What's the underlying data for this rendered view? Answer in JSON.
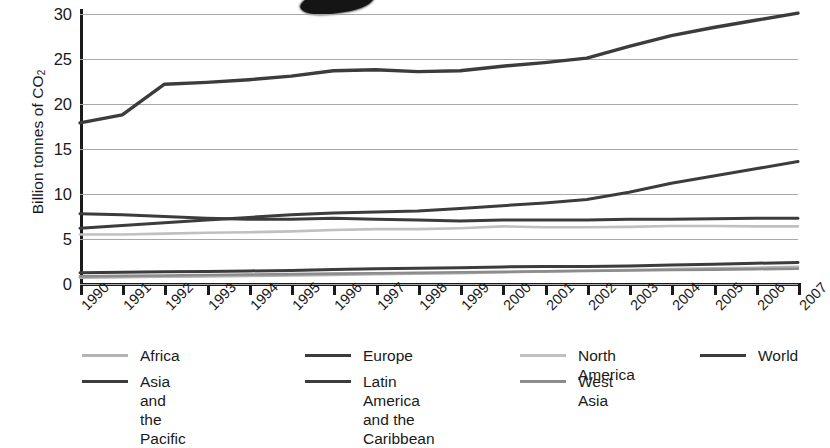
{
  "chart_data": {
    "type": "line",
    "title": "",
    "xlabel": "",
    "ylabel": "Billion tonnes of CO2",
    "ylabel_display": "Billion tonnes of CO",
    "ylabel_sub": "2",
    "ylim": [
      0,
      30
    ],
    "yticks": [
      0,
      5,
      10,
      15,
      20,
      25,
      30
    ],
    "grid": true,
    "legend_position": "bottom",
    "x": [
      1990,
      1991,
      1992,
      1993,
      1994,
      1995,
      1996,
      1997,
      1998,
      1999,
      2000,
      2001,
      2002,
      2003,
      2004,
      2005,
      2006,
      2007
    ],
    "categories": [
      "1990",
      "1991",
      "1992",
      "1993",
      "1994",
      "1995",
      "1996",
      "1997",
      "1998",
      "1999",
      "2000",
      "2001",
      "2002",
      "2003",
      "2004",
      "2005",
      "2006",
      "2007"
    ],
    "series": [
      {
        "name": "Africa",
        "color": "#b4b4b4",
        "width": 2.6,
        "values": [
          0.7,
          0.75,
          0.8,
          0.85,
          0.9,
          0.95,
          1.0,
          1.1,
          1.15,
          1.2,
          1.3,
          1.4,
          1.5,
          1.55,
          1.65,
          1.75,
          1.8,
          1.9
        ]
      },
      {
        "name": "Asia and the Pacific",
        "color": "#3c3c3c",
        "width": 3.0,
        "values": [
          6.2,
          6.5,
          6.8,
          7.1,
          7.4,
          7.7,
          7.9,
          8.0,
          8.1,
          8.4,
          8.7,
          9.0,
          9.4,
          10.2,
          11.2,
          12.0,
          12.8,
          13.6
        ]
      },
      {
        "name": "Europe",
        "color": "#3c3c3c",
        "width": 3.0,
        "values": [
          7.8,
          7.7,
          7.5,
          7.3,
          7.2,
          7.2,
          7.3,
          7.2,
          7.1,
          7.0,
          7.1,
          7.1,
          7.1,
          7.2,
          7.2,
          7.25,
          7.3,
          7.3
        ]
      },
      {
        "name": "Latin America and the Caribbean",
        "color": "#3c3c3c",
        "width": 3.0,
        "values": [
          1.25,
          1.3,
          1.35,
          1.4,
          1.45,
          1.5,
          1.6,
          1.7,
          1.75,
          1.8,
          1.9,
          1.95,
          1.95,
          2.0,
          2.1,
          2.2,
          2.3,
          2.4
        ]
      },
      {
        "name": "North America",
        "color": "#c0c0c0",
        "width": 2.6,
        "values": [
          5.5,
          5.5,
          5.6,
          5.7,
          5.75,
          5.85,
          6.0,
          6.1,
          6.1,
          6.2,
          6.4,
          6.3,
          6.3,
          6.35,
          6.45,
          6.45,
          6.4,
          6.4
        ]
      },
      {
        "name": "West Asia",
        "color": "#8c8c8c",
        "width": 2.6,
        "values": [
          0.85,
          0.9,
          0.95,
          1.0,
          1.05,
          1.1,
          1.15,
          1.2,
          1.25,
          1.3,
          1.35,
          1.4,
          1.45,
          1.5,
          1.55,
          1.6,
          1.65,
          1.7
        ]
      },
      {
        "name": "World",
        "color": "#3c3c3c",
        "width": 3.4,
        "values": [
          17.9,
          18.8,
          22.2,
          22.4,
          22.7,
          23.1,
          23.7,
          23.8,
          23.6,
          23.7,
          24.2,
          24.6,
          25.1,
          26.4,
          27.6,
          28.5,
          29.3,
          30.1
        ]
      }
    ]
  },
  "yaxis": {
    "labels": [
      "30",
      "25",
      "20",
      "15",
      "10",
      "5",
      "0"
    ],
    "title_main": "Billion tonnes of CO",
    "title_sub": "2"
  },
  "xaxis": {
    "labels": [
      "1990",
      "1991",
      "1992",
      "1993",
      "1994",
      "1995",
      "1996",
      "1997",
      "1998",
      "1999",
      "2000",
      "2001",
      "2002",
      "2003",
      "2004",
      "2005",
      "2006",
      "2007"
    ]
  },
  "legend": {
    "items": [
      {
        "label": "Africa",
        "color": "#b4b4b4",
        "col": 0,
        "row": 0
      },
      {
        "label": "Asia and\nthe Pacific",
        "color": "#3c3c3c",
        "col": 0,
        "row": 1
      },
      {
        "label": "Europe",
        "color": "#3c3c3c",
        "col": 1,
        "row": 0
      },
      {
        "label": "Latin America\nand the Caribbean",
        "color": "#3c3c3c",
        "col": 1,
        "row": 1
      },
      {
        "label": "North America",
        "color": "#c0c0c0",
        "col": 2,
        "row": 0
      },
      {
        "label": "West Asia",
        "color": "#8c8c8c",
        "col": 2,
        "row": 1
      },
      {
        "label": "World",
        "color": "#3c3c3c",
        "col": 3,
        "row": 0
      }
    ]
  },
  "colors": {
    "axis": "#1a1a1a",
    "grid": "#a8a8a8",
    "dark_series": "#3c3c3c",
    "mid_series": "#8c8c8c",
    "light_series": "#c0c0c0",
    "background": "#ffffff"
  }
}
